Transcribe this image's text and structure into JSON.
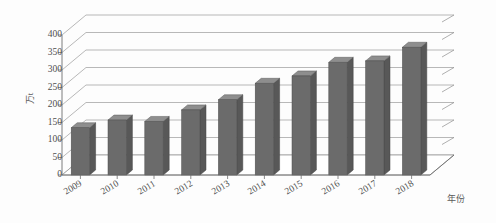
{
  "chart_data": {
    "type": "bar",
    "title": "",
    "subtitle": "",
    "xlabel": "年份",
    "ylabel": "万t",
    "categories": [
      "2009",
      "2010",
      "2011",
      "2012",
      "2013",
      "2014",
      "2015",
      "2016",
      "2017",
      "2018"
    ],
    "values": [
      135,
      157,
      153,
      186,
      215,
      262,
      283,
      322,
      326,
      365
    ],
    "series": [
      {
        "name": "产量",
        "values": [
          135,
          157,
          153,
          186,
          215,
          262,
          283,
          322,
          326,
          365
        ]
      }
    ],
    "ylim": [
      0,
      400
    ],
    "ytick_labels": [
      "400",
      "350",
      "300",
      "250",
      "200",
      "150",
      "100",
      "50",
      "0"
    ],
    "ytick_values": [
      400,
      350,
      300,
      250,
      200,
      150,
      100,
      50,
      0
    ],
    "ytick_step": 50,
    "grid": true,
    "legend": false,
    "legend_position": "none",
    "style": "3d-column",
    "colors": {
      "bar_front": "#6b6b6b",
      "bar_top": "#8e8e8e",
      "bar_side": "#585858",
      "grid": "#9a9a9a",
      "axis": "#6e6e6e",
      "text": "#4f4f4f",
      "background": "#fdfdfd"
    },
    "annotations": []
  }
}
